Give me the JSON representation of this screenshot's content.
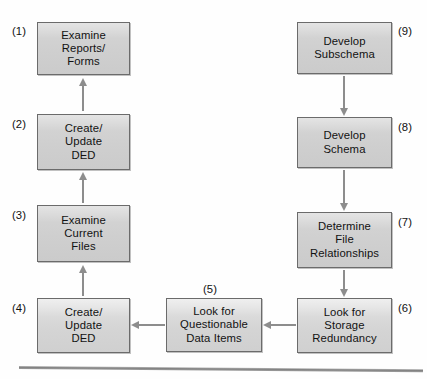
{
  "diagram": {
    "background_color": "#fefefe",
    "box_fill_color": "#d2d2d2",
    "box_border_color": "#6b6b6b",
    "arrow_color": "#8d8d8d",
    "rule_color": "#828282",
    "nodes": [
      {
        "id": "1",
        "label": "(1)",
        "text": "Examine\nReports/\nForms",
        "x": 37,
        "y": 22,
        "w": 93,
        "h": 53,
        "label_side": "left"
      },
      {
        "id": "2",
        "label": "(2)",
        "text": "Create/\nUpdate\nDED",
        "x": 37,
        "y": 114,
        "w": 93,
        "h": 56,
        "label_side": "left"
      },
      {
        "id": "3",
        "label": "(3)",
        "text": "Examine\nCurrent\nFiles",
        "x": 37,
        "y": 205,
        "w": 93,
        "h": 57,
        "label_side": "left"
      },
      {
        "id": "4",
        "label": "(4)",
        "text": "Create/\nUpdate\nDED",
        "x": 37,
        "y": 298,
        "w": 93,
        "h": 55,
        "label_side": "left"
      },
      {
        "id": "5",
        "label": "(5)",
        "text": "Look for\nQuestionable\nData Items",
        "x": 166,
        "y": 298,
        "w": 96,
        "h": 54,
        "label_side": "top"
      },
      {
        "id": "6",
        "label": "(6)",
        "text": "Look for\nStorage\nRedundancy",
        "x": 297,
        "y": 298,
        "w": 95,
        "h": 55,
        "label_side": "right"
      },
      {
        "id": "7",
        "label": "(7)",
        "text": "Determine\nFile\nRelationships",
        "x": 297,
        "y": 212,
        "w": 95,
        "h": 56,
        "label_side": "right"
      },
      {
        "id": "8",
        "label": "(8)",
        "text": "Develop\nSchema",
        "x": 297,
        "y": 117,
        "w": 95,
        "h": 51,
        "label_side": "right"
      },
      {
        "id": "9",
        "label": "(9)",
        "text": "Develop\nSubschema",
        "x": 297,
        "y": 22,
        "w": 95,
        "h": 52,
        "label_side": "right"
      }
    ],
    "edges": [
      {
        "from": "2",
        "to": "1",
        "direction": "up"
      },
      {
        "from": "3",
        "to": "2",
        "direction": "up"
      },
      {
        "from": "4",
        "to": "3",
        "direction": "up"
      },
      {
        "from": "5",
        "to": "4",
        "direction": "left"
      },
      {
        "from": "6",
        "to": "5",
        "direction": "left"
      },
      {
        "from": "7",
        "to": "6",
        "direction": "down"
      },
      {
        "from": "8",
        "to": "7",
        "direction": "down"
      },
      {
        "from": "9",
        "to": "8",
        "direction": "down"
      }
    ]
  }
}
